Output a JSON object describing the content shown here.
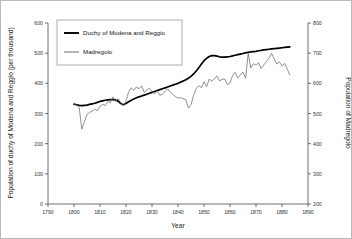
{
  "chart_data": {
    "type": "line",
    "title": "",
    "xlabel": "Year",
    "ylabel": "Population of duchy of  Modena and Reggio (per thousand)",
    "y2label": "Population of Madregolo",
    "xlim": [
      1790,
      1890
    ],
    "ylim": [
      0,
      600
    ],
    "y2lim": [
      200,
      800
    ],
    "xticks": [
      1790,
      1800,
      1810,
      1820,
      1830,
      1840,
      1850,
      1860,
      1870,
      1880,
      1890
    ],
    "yticks": [
      0,
      100,
      200,
      300,
      400,
      500,
      600
    ],
    "y2ticks": [
      200,
      300,
      400,
      500,
      600,
      700,
      800
    ],
    "grid": false,
    "legend_position": "top-left",
    "series": [
      {
        "name": "Duchy of Modena and Reggio",
        "axis": "left",
        "color": "#000000",
        "x": [
          1800,
          1801,
          1802,
          1803,
          1804,
          1805,
          1806,
          1807,
          1808,
          1809,
          1810,
          1811,
          1812,
          1813,
          1814,
          1815,
          1816,
          1817,
          1818,
          1819,
          1820,
          1821,
          1822,
          1823,
          1824,
          1825,
          1826,
          1827,
          1828,
          1829,
          1830,
          1831,
          1832,
          1833,
          1834,
          1835,
          1836,
          1837,
          1838,
          1839,
          1840,
          1841,
          1842,
          1843,
          1844,
          1845,
          1846,
          1847,
          1848,
          1849,
          1850,
          1851,
          1852,
          1853,
          1854,
          1855,
          1856,
          1857,
          1858,
          1859,
          1860,
          1861,
          1862,
          1863,
          1864,
          1865,
          1866,
          1867,
          1868,
          1869,
          1870,
          1871,
          1872,
          1873,
          1874,
          1875,
          1876,
          1877,
          1878,
          1879,
          1880,
          1881,
          1882,
          1883
        ],
        "values": [
          331,
          329,
          327,
          326,
          327,
          328,
          330,
          332,
          334,
          337,
          340,
          342,
          344,
          345,
          346,
          346,
          345,
          341,
          333,
          329,
          333,
          339,
          344,
          348,
          352,
          355,
          358,
          361,
          364,
          367,
          370,
          373,
          376,
          379,
          382,
          385,
          388,
          391,
          394,
          397,
          400,
          404,
          408,
          412,
          417,
          423,
          431,
          441,
          452,
          464,
          475,
          483,
          489,
          492,
          492,
          490,
          488,
          487,
          487,
          488,
          489,
          491,
          493,
          495,
          497,
          499,
          501,
          503,
          504,
          505,
          506,
          508,
          509,
          511,
          512,
          513,
          514,
          515,
          516,
          517,
          518,
          519,
          520,
          521
        ]
      },
      {
        "name": "Madregolo",
        "axis": "right",
        "color": "#6b6b6b",
        "x": [
          1800,
          1801,
          1802,
          1803,
          1804,
          1805,
          1806,
          1807,
          1808,
          1809,
          1810,
          1811,
          1812,
          1813,
          1814,
          1815,
          1816,
          1817,
          1818,
          1819,
          1820,
          1821,
          1822,
          1823,
          1824,
          1825,
          1826,
          1827,
          1828,
          1829,
          1830,
          1831,
          1832,
          1833,
          1834,
          1835,
          1836,
          1837,
          1838,
          1839,
          1840,
          1841,
          1842,
          1843,
          1844,
          1845,
          1846,
          1847,
          1848,
          1849,
          1850,
          1851,
          1852,
          1853,
          1854,
          1855,
          1856,
          1857,
          1858,
          1859,
          1860,
          1861,
          1862,
          1863,
          1864,
          1865,
          1866,
          1867,
          1868,
          1869,
          1870,
          1871,
          1872,
          1873,
          1874,
          1875,
          1876,
          1877,
          1878,
          1879,
          1880,
          1881,
          1882,
          1883
        ],
        "values": [
          533,
          528,
          520,
          448,
          473,
          497,
          503,
          508,
          514,
          509,
          524,
          530,
          526,
          540,
          536,
          555,
          540,
          549,
          536,
          525,
          541,
          571,
          585,
          577,
          588,
          582,
          592,
          570,
          578,
          584,
          573,
          565,
          575,
          560,
          564,
          572,
          582,
          571,
          563,
          556,
          551,
          553,
          549,
          546,
          518,
          529,
          560,
          583,
          592,
          586,
          605,
          589,
          614,
          607,
          616,
          624,
          608,
          613,
          614,
          596,
          601,
          626,
          636,
          618,
          629,
          637,
          617,
          700,
          651,
          665,
          660,
          668,
          649,
          661,
          672,
          684,
          699,
          681,
          664,
          671,
          657,
          666,
          648,
          627
        ]
      }
    ]
  },
  "legend": {
    "items": [
      {
        "label": "Duchy of Modena and Reggio"
      },
      {
        "label": "Madregolo"
      }
    ]
  }
}
